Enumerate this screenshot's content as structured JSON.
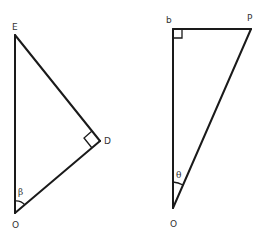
{
  "diagram": {
    "type": "geometry",
    "stroke_color": "#1a1a1a",
    "label_color": "#333333",
    "triangles": [
      {
        "id": "left",
        "vertices": {
          "E": {
            "label": "E"
          },
          "D": {
            "label": "D"
          },
          "O": {
            "label": "O"
          }
        },
        "right_angle_at": "D",
        "angle_mark": {
          "at": "O",
          "label": "β"
        }
      },
      {
        "id": "right",
        "vertices": {
          "b": {
            "label": "b"
          },
          "P": {
            "label": "P"
          },
          "O": {
            "label": "O"
          }
        },
        "right_angle_at": "b",
        "angle_mark": {
          "at": "O",
          "label": "θ"
        }
      }
    ]
  }
}
